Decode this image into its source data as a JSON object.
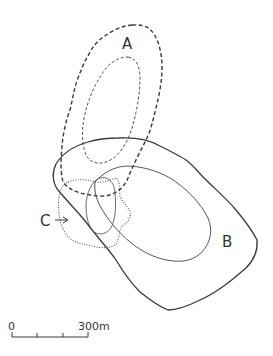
{
  "figure": {
    "type": "contour-map",
    "line_color": "#3a3a3a",
    "background": "#ffffff"
  },
  "regions": [
    {
      "id": "A",
      "label": "A",
      "style": "dashed",
      "contours": 2
    },
    {
      "id": "B",
      "label": "B",
      "style": "solid",
      "contours": 2
    },
    {
      "id": "C",
      "label": "C",
      "style": "dotted",
      "contours": 2,
      "pointer": "arrow"
    }
  ],
  "labels": {
    "a": "A",
    "b": "B",
    "c": "C"
  },
  "scale_bar": {
    "start_label": "0",
    "end_label": "300m",
    "ticks": 4
  }
}
